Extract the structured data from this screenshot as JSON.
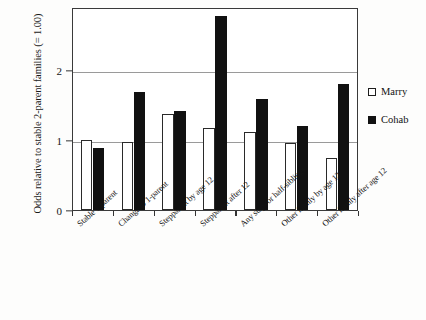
{
  "chart_data": {
    "type": "bar",
    "title": "",
    "xlabel": "",
    "ylabel": "Odds relative to stable 2-parent families (= 1.00)",
    "ylim": [
      0,
      2.9
    ],
    "yticks": [
      0,
      1,
      2
    ],
    "ytick_labels": [
      "0",
      "1",
      "2"
    ],
    "grid": true,
    "legend_position": "right",
    "categories": [
      "Stable 1-parent",
      "Change  to 1-parent",
      "Stepparent by age 12",
      "Stepparent after 12",
      "Any step- or half-siblings",
      "Other family by age 12",
      "Other family after age 12"
    ],
    "series": [
      {
        "name": "Marry",
        "color": "#ffffff",
        "values": [
          1.0,
          0.97,
          1.37,
          1.17,
          1.12,
          0.96,
          0.74
        ]
      },
      {
        "name": "Cohab",
        "color": "#111111",
        "values": [
          0.88,
          1.69,
          1.42,
          2.77,
          1.58,
          1.2,
          1.8
        ]
      }
    ]
  },
  "legend": {
    "items": [
      {
        "label": "Marry",
        "swatch": "hollow-square"
      },
      {
        "label": "Cohab",
        "swatch": "filled-square"
      }
    ]
  }
}
